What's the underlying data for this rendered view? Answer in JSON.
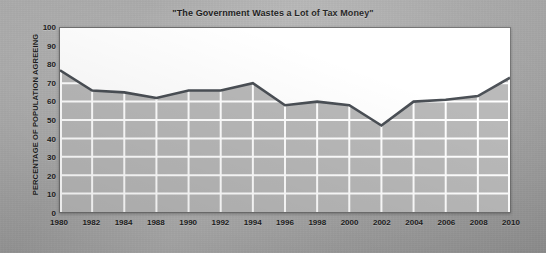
{
  "chart_data": {
    "type": "area",
    "title": "\"The Government Wastes a Lot of Tax Money\"",
    "xlabel": "",
    "ylabel": "PERCENTAGE OF POPULATION AGREEING",
    "ylim": [
      0,
      100
    ],
    "ytick_step": 10,
    "yticks": [
      100,
      90,
      80,
      70,
      60,
      50,
      40,
      30,
      20,
      10,
      0
    ],
    "xticks": [
      "1980",
      "1982",
      "1984",
      "1988",
      "1990",
      "1992",
      "1994",
      "1996",
      "1998",
      "2000",
      "2002",
      "2004",
      "2006",
      "2008",
      "2010"
    ],
    "categories": [
      "1980",
      "1982",
      "1984",
      "1988",
      "1990",
      "1992",
      "1994",
      "1996",
      "1998",
      "2000",
      "2002",
      "2004",
      "2006",
      "2008",
      "2010"
    ],
    "values": [
      77,
      66,
      65,
      62,
      66,
      66,
      70,
      58,
      60,
      58,
      47,
      60,
      61,
      63,
      73
    ],
    "grid": true,
    "legend": false,
    "colors": {
      "line": "#4a4f55",
      "fill": "#b9b9b9",
      "gridline": "#ffffff",
      "plot_background": "#ffffff",
      "page_background": "#9c9c9c",
      "text": "#1d1d1d"
    }
  }
}
